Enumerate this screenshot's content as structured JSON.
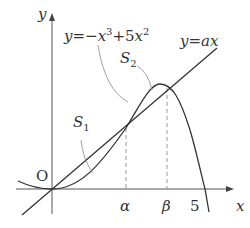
{
  "diagram": {
    "axis_x_label": "x",
    "axis_y_label": "y",
    "origin_label": "O",
    "curve_label": {
      "lhs": "y",
      "eq": "=",
      "minus": "−",
      "x": "x",
      "exp3": "3",
      "plus5": "+5",
      "x2": "x",
      "exp2": "2"
    },
    "line_label": {
      "lhs": "y",
      "eq": "=",
      "rhs": "ax"
    },
    "region_labels": [
      {
        "name": "S",
        "sub": "1"
      },
      {
        "name": "S",
        "sub": "2"
      }
    ],
    "tick_labels": [
      "α",
      "β",
      "5"
    ],
    "colors": {
      "stroke": "#333333",
      "dash": "#999999",
      "leader": "#888888"
    }
  }
}
